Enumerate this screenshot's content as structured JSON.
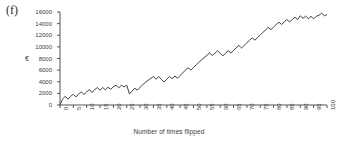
{
  "figure": {
    "panel_label": "(f)",
    "background_color": "#ffffff",
    "line_color": "#404040",
    "axis_color": "#555555"
  },
  "chart_data": {
    "type": "line",
    "title": "",
    "subtitle": "",
    "xlabel": "Number of times flipped",
    "ylabel": "€",
    "xlim": [
      0,
      100
    ],
    "ylim": [
      0,
      16000
    ],
    "grid": false,
    "legend": null,
    "legend_position": "none",
    "xticks": [
      0,
      5,
      10,
      15,
      20,
      25,
      30,
      35,
      40,
      45,
      50,
      55,
      60,
      65,
      70,
      75,
      80,
      85,
      90,
      95,
      100
    ],
    "xtick_labels": [
      "0",
      "5",
      "10",
      "15",
      "20",
      "25",
      "30",
      "35",
      "40",
      "45",
      "50",
      "55",
      "60",
      "65",
      "70",
      "75",
      "80",
      "85",
      "90",
      "95",
      "100"
    ],
    "yticks": [
      0,
      2000,
      4000,
      6000,
      8000,
      10000,
      12000,
      14000,
      16000
    ],
    "ytick_labels": [
      "0",
      "2000",
      "4000",
      "6000",
      "8000",
      "10000",
      "12000",
      "14000",
      "16000"
    ],
    "series": [
      {
        "name": "cumulative winnings",
        "x": [
          0,
          1,
          2,
          3,
          4,
          5,
          6,
          7,
          8,
          9,
          10,
          11,
          12,
          13,
          14,
          15,
          16,
          17,
          18,
          19,
          20,
          21,
          22,
          23,
          24,
          25,
          26,
          27,
          28,
          29,
          30,
          31,
          32,
          33,
          34,
          35,
          36,
          37,
          38,
          39,
          40,
          41,
          42,
          43,
          44,
          45,
          46,
          47,
          48,
          49,
          50,
          51,
          52,
          53,
          54,
          55,
          56,
          57,
          58,
          59,
          60,
          61,
          62,
          63,
          64,
          65,
          66,
          67,
          68,
          69,
          70,
          71,
          72,
          73,
          74,
          75,
          76,
          77,
          78,
          79,
          80,
          81,
          82,
          83,
          84,
          85,
          86,
          87,
          88,
          89,
          90,
          91,
          92,
          93,
          94,
          95,
          96,
          97,
          98,
          99,
          100
        ],
        "y": [
          0,
          1050,
          1500,
          1000,
          1500,
          1850,
          1400,
          1900,
          2250,
          1800,
          2250,
          2650,
          2150,
          2650,
          3000,
          2550,
          3000,
          2600,
          3050,
          2700,
          3150,
          3400,
          2950,
          3400,
          3100,
          3400,
          1900,
          2400,
          2900,
          2550,
          3050,
          3500,
          3900,
          4250,
          4600,
          4900,
          4450,
          4900,
          4400,
          3950,
          4450,
          4900,
          4500,
          5000,
          4600,
          5100,
          5550,
          6000,
          6400,
          6000,
          6450,
          6900,
          7350,
          7750,
          8150,
          8550,
          8950,
          8500,
          8900,
          9350,
          8900,
          8450,
          8900,
          9350,
          8950,
          9400,
          9850,
          10250,
          9800,
          10250,
          10700,
          11150,
          11550,
          11150,
          11600,
          12050,
          12500,
          12900,
          13350,
          12950,
          13400,
          13850,
          14250,
          13850,
          14300,
          14700,
          14300,
          14700,
          15100,
          14700,
          15350,
          14900,
          15300,
          14850,
          15250,
          14850,
          15250,
          15450,
          15800,
          15350,
          15550
        ]
      }
    ]
  }
}
